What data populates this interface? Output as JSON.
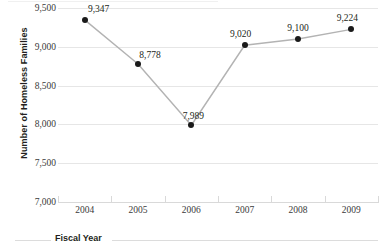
{
  "chart_data": {
    "type": "line",
    "title": "",
    "xlabel": "Fiscal Year",
    "ylabel": "Number of Homeless Families",
    "categories": [
      "2004",
      "2005",
      "2006",
      "2007",
      "2008",
      "2009"
    ],
    "values": [
      9347,
      8778,
      7989,
      9020,
      9100,
      9224
    ],
    "point_labels": [
      "9,347",
      "8,778",
      "7,989",
      "9,020",
      "9,100",
      "9,224"
    ],
    "ylim": [
      7000,
      9500
    ],
    "yticks": [
      9500,
      9000,
      8500,
      8000,
      7500,
      7000
    ],
    "ytick_labels": [
      "9,500",
      "9,000",
      "8,500",
      "8,000",
      "7,500",
      "7,000"
    ],
    "grid": true,
    "legend": "none",
    "series": [
      {
        "name": "Number of Homeless Families",
        "values": [
          9347,
          8778,
          7989,
          9020,
          9100,
          9224
        ],
        "line_color": "#b3b3b3",
        "marker_color": "#1a1a1a"
      }
    ]
  },
  "colors": {
    "gridline": "#e6e6e6",
    "axis": "#d9d9d9",
    "line": "#b3b3b3",
    "marker": "#1a1a1a",
    "text": "#231f20",
    "tick_text": "#3a3a3a",
    "background": "#ffffff"
  }
}
